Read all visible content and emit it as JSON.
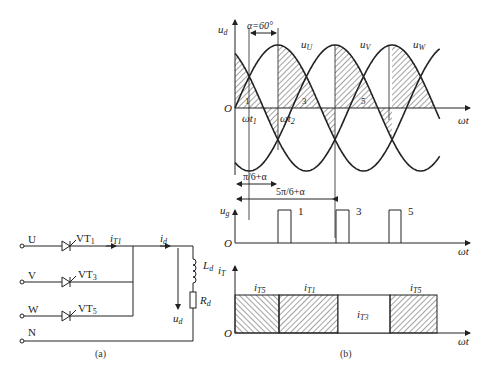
{
  "circuit": {
    "phases": [
      {
        "terminal": "U",
        "thyristor": "VT",
        "thyristor_sub": "1",
        "current": "i",
        "current_sub": "T1"
      },
      {
        "terminal": "V",
        "thyristor": "VT",
        "thyristor_sub": "3"
      },
      {
        "terminal": "W",
        "thyristor": "VT",
        "thyristor_sub": "5"
      }
    ],
    "neutral": "N",
    "load_current": "i",
    "load_current_sub": "d",
    "inductor": "L",
    "inductor_sub": "d",
    "resistor": "R",
    "resistor_sub": "d",
    "output_voltage": "u",
    "output_voltage_sub": "d",
    "caption": "(a)"
  },
  "waveforms": {
    "voltage_axis": "u",
    "voltage_axis_sub": "d",
    "origin": "O",
    "x_axis": "ωt",
    "alpha_label": "α=60°",
    "phase_labels": [
      {
        "name": "u",
        "sub": "U"
      },
      {
        "name": "u",
        "sub": "V"
      },
      {
        "name": "u",
        "sub": "W"
      }
    ],
    "t1": "ωt",
    "t1_sub": "1",
    "t2": "ωt",
    "t2_sub": "2",
    "segment_numbers": [
      "1",
      "3",
      "5"
    ],
    "dim1": "π/6+α",
    "dim2": "5π/6+α",
    "gate_axis": "u",
    "gate_axis_sub": "g",
    "gate_pulse_labels": [
      "1",
      "3",
      "5"
    ],
    "current_axis": "i",
    "current_axis_sub": "T",
    "current_segments": [
      {
        "name": "i",
        "sub": "T5"
      },
      {
        "name": "i",
        "sub": "T1"
      },
      {
        "name": "i",
        "sub": "T3"
      },
      {
        "name": "i",
        "sub": "T5"
      }
    ],
    "caption": "(b)"
  },
  "chart_data": {
    "type": "line",
    "series": [
      {
        "name": "uU",
        "phase_deg": 0
      },
      {
        "name": "uV",
        "phase_deg": -120
      },
      {
        "name": "uW",
        "phase_deg": -240
      }
    ],
    "alpha_deg": 60,
    "gate_pulses_deg": [
      90,
      210,
      330
    ],
    "conduction": [
      {
        "thyristor": "T5",
        "from_deg": 0,
        "to_deg": 90
      },
      {
        "thyristor": "T1",
        "from_deg": 90,
        "to_deg": 210
      },
      {
        "thyristor": "T3",
        "from_deg": 210,
        "to_deg": 330
      },
      {
        "thyristor": "T5",
        "from_deg": 330,
        "to_deg": 420
      }
    ],
    "xlabel": "ωt",
    "ylabel": "ud"
  }
}
